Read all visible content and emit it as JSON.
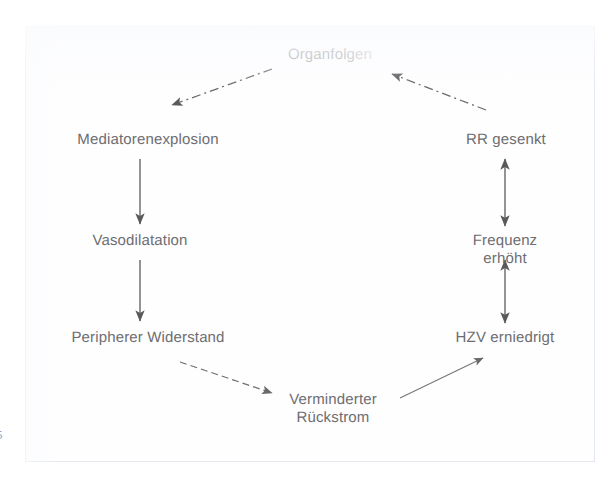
{
  "figure": {
    "kind": "cycle-flowchart",
    "language": "de",
    "frame_border_color": "#e2e8ee",
    "text_color": "#6d6d70",
    "arrow_color": "#5a5a5d",
    "background_color": "#ffffff",
    "page_edge_mark": "5"
  },
  "nodes": [
    {
      "id": "organfolgen",
      "label": "Organfolgen",
      "x": 330,
      "y": 56,
      "faded": true
    },
    {
      "id": "mediatorenexplosion",
      "label": "Mediatorenexplosion",
      "x": 148,
      "y": 141,
      "faded": false
    },
    {
      "id": "rr-gesenkt",
      "label": "RR gesenkt",
      "x": 506,
      "y": 141,
      "faded": false
    },
    {
      "id": "vasodilatation",
      "label": "Vasodilatation",
      "x": 140,
      "y": 242,
      "faded": false
    },
    {
      "id": "frequenz-erhoeht",
      "label": "Frequenz erhöht",
      "x": 505,
      "y": 242,
      "faded": false
    },
    {
      "id": "peripherer-widerstand",
      "label": "Peripherer Widerstand",
      "x": 148,
      "y": 339,
      "faded": false
    },
    {
      "id": "hzv-erniedrigt",
      "label": "HZV erniedrigt",
      "x": 505,
      "y": 339,
      "faded": false
    },
    {
      "id": "verminderter-rueckstrom",
      "label": "Verminderter\nRückstrom",
      "x": 333,
      "y": 400,
      "faded": false
    }
  ],
  "edges": [
    {
      "id": "organfolgen-to-mediatorenexplosion",
      "from": "organfolgen",
      "to": "mediatorenexplosion",
      "style": "dashed",
      "heads": "end"
    },
    {
      "id": "mediatorenexplosion-to-vasodilatation",
      "from": "mediatorenexplosion",
      "to": "vasodilatation",
      "style": "solid",
      "heads": "end"
    },
    {
      "id": "vasodilatation-to-peripherer-widerstand",
      "from": "vasodilatation",
      "to": "peripherer-widerstand",
      "style": "solid",
      "heads": "end"
    },
    {
      "id": "peripherer-widerstand-to-verminderter-rueckstrom",
      "from": "peripherer-widerstand",
      "to": "verminderter-rueckstrom",
      "style": "dashed",
      "heads": "end"
    },
    {
      "id": "verminderter-rueckstrom-to-hzv-erniedrigt",
      "from": "verminderter-rueckstrom",
      "to": "hzv-erniedrigt",
      "style": "solid",
      "heads": "end"
    },
    {
      "id": "hzv-erniedrigt-to-frequenz-erhoeht",
      "from": "hzv-erniedrigt",
      "to": "frequenz-erhoeht",
      "style": "solid",
      "heads": "both"
    },
    {
      "id": "frequenz-erhoeht-to-rr-gesenkt",
      "from": "frequenz-erhoeht",
      "to": "rr-gesenkt",
      "style": "solid",
      "heads": "both"
    },
    {
      "id": "rr-gesenkt-to-organfolgen",
      "from": "rr-gesenkt",
      "to": "organfolgen",
      "style": "dashed",
      "heads": "end"
    }
  ]
}
